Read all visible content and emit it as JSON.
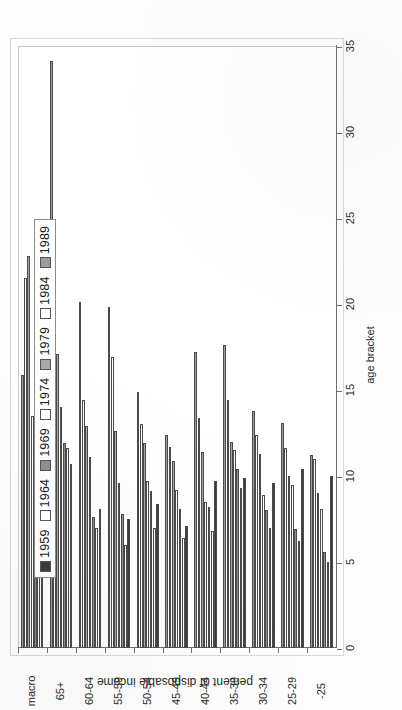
{
  "chart_data": {
    "type": "bar",
    "orientation": "horizontal",
    "title": "",
    "xlabel": "age bracket",
    "ylabel": "percent of disposable income",
    "value_axis_ticks": [
      "0",
      "5",
      "10",
      "15",
      "20",
      "25",
      "30",
      "35"
    ],
    "ylim": [
      0,
      35
    ],
    "grid": false,
    "legend_position": "upper-left-inside",
    "categories": [
      "-25",
      "25-29",
      "30-34",
      "35-39",
      "40-44",
      "45-49",
      "50-54",
      "55-59",
      "60-64",
      "65+",
      "macro"
    ],
    "series": [
      {
        "name": "1959",
        "color": "#3c3c3c",
        "values": [
          10.0,
          10.4,
          9.6,
          9.9,
          9.7,
          7.1,
          8.4,
          7.5,
          8.1,
          10.7,
          9.6
        ]
      },
      {
        "name": "1964",
        "color": "#ffffff",
        "values": [
          5.0,
          6.2,
          7.0,
          9.3,
          6.8,
          6.4,
          7.0,
          6.0,
          7.0,
          11.6,
          7.5
        ]
      },
      {
        "name": "1969",
        "color": "#8f8f8f",
        "values": [
          5.6,
          6.9,
          8.0,
          10.4,
          8.2,
          8.1,
          9.1,
          7.8,
          7.6,
          11.9,
          11.0
        ]
      },
      {
        "name": "1974",
        "color": "#ffffff",
        "values": [
          8.1,
          9.5,
          8.9,
          11.5,
          8.5,
          9.2,
          9.7,
          9.6,
          11.1,
          14.0,
          13.5
        ]
      },
      {
        "name": "1979",
        "color": "#a8a8a8",
        "values": [
          9.0,
          10.0,
          11.3,
          12.0,
          11.4,
          10.9,
          11.9,
          12.6,
          12.9,
          17.1,
          22.8
        ]
      },
      {
        "name": "1984",
        "color": "#ffffff",
        "values": [
          11.0,
          11.6,
          12.4,
          14.4,
          13.4,
          11.7,
          13.0,
          16.9,
          14.4,
          23.1,
          21.5
        ]
      },
      {
        "name": "1989",
        "color": "#9b9b9b",
        "values": [
          11.2,
          13.1,
          13.8,
          17.6,
          17.2,
          12.4,
          14.9,
          19.8,
          20.1,
          34.1,
          15.9
        ]
      }
    ]
  },
  "legend": {
    "items": [
      {
        "label": "1959"
      },
      {
        "label": "1964"
      },
      {
        "label": "1969"
      },
      {
        "label": "1974"
      },
      {
        "label": "1979"
      },
      {
        "label": "1984"
      },
      {
        "label": "1989"
      }
    ]
  }
}
